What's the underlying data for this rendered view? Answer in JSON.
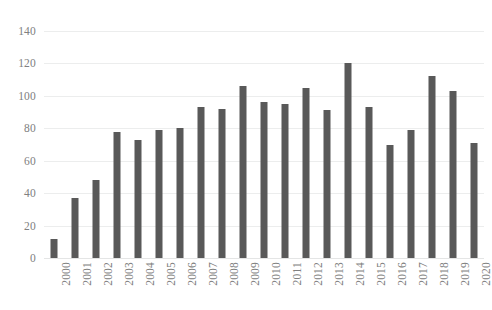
{
  "chart_data": {
    "type": "bar",
    "title": "",
    "subtitle": "",
    "xlabel": "",
    "ylabel": "",
    "ylim": [
      0,
      140
    ],
    "yticks": [
      0,
      20,
      40,
      60,
      80,
      100,
      120,
      140
    ],
    "ytick_labels": [
      "0",
      "20",
      "40",
      "60",
      "80",
      "100",
      "120",
      "140"
    ],
    "grid": true,
    "legend": null,
    "legend_position": "none",
    "bar_color": "#595959",
    "gridline_color": "#ECEDED",
    "tick_label_color": "#808080",
    "background_color": "#FFFFFF",
    "xtick_rotation": -90,
    "categories": [
      "2000",
      "2001",
      "2002",
      "2003",
      "2004",
      "2005",
      "2006",
      "2007",
      "2008",
      "2009",
      "2010",
      "2011",
      "2012",
      "2013",
      "2014",
      "2015",
      "2016",
      "2017",
      "2018",
      "2019",
      "2020"
    ],
    "values": [
      12,
      37,
      48,
      78,
      73,
      79,
      80,
      93,
      92,
      106,
      96,
      95,
      105,
      91,
      120,
      93,
      70,
      79,
      112,
      103,
      71
    ]
  }
}
